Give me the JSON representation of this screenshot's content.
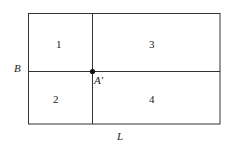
{
  "diagram": {
    "regions": [
      {
        "id": "1",
        "label": "1"
      },
      {
        "id": "2",
        "label": "2"
      },
      {
        "id": "3",
        "label": "3"
      },
      {
        "id": "4",
        "label": "4"
      }
    ],
    "side_labels": {
      "left": "B",
      "bottom": "L"
    },
    "point_label": "A′",
    "colors": {
      "stroke": "#333333",
      "text": "#222222"
    }
  }
}
